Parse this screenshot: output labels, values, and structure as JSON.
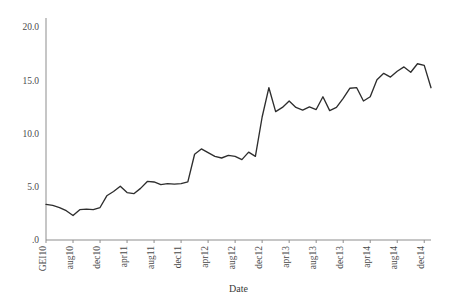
{
  "chart_data": {
    "type": "line",
    "title": "",
    "subtitle": "",
    "xlabel": "Date",
    "ylabel": "",
    "grid": false,
    "legend": "none",
    "ylim": [
      0,
      20
    ],
    "yticks": [
      0,
      5,
      10,
      15,
      20
    ],
    "ytick_labels": [
      ".0",
      "5.0",
      "10.0",
      "15.0",
      "20.0"
    ],
    "xtick_labels": [
      "GEI10",
      "aug10",
      "dec10",
      "apr11",
      "aug11",
      "dec11",
      "apr12",
      "aug12",
      "dec12",
      "apr13",
      "aug13",
      "dec13",
      "apr14",
      "aug14",
      "dec14"
    ],
    "x_tick_every": 4,
    "line_color": "#2e2e2e",
    "axis_color": "#8d8d8d",
    "x": [
      "GEI10",
      "m1",
      "m2",
      "m3",
      "aug10",
      "m5",
      "m6",
      "m7",
      "dec10",
      "m9",
      "m10",
      "m11",
      "apr11",
      "m13",
      "m14",
      "m15",
      "aug11",
      "m17",
      "m18",
      "m19",
      "dec11",
      "m21",
      "m22",
      "m23",
      "apr12",
      "m25",
      "m26",
      "m27",
      "aug12",
      "m29",
      "m30",
      "m31",
      "dec12",
      "m33",
      "m34",
      "m35",
      "apr13",
      "m37",
      "m38",
      "m39",
      "aug13",
      "m41",
      "m42",
      "m43",
      "dec13",
      "m45",
      "m46",
      "m47",
      "apr14",
      "m49",
      "m50",
      "m51",
      "aug14",
      "m53",
      "m54",
      "m55",
      "dec14",
      "m57"
    ],
    "values": [
      3.35,
      3.25,
      3.05,
      2.75,
      2.3,
      2.85,
      2.9,
      2.85,
      3.05,
      4.15,
      4.55,
      5.05,
      4.45,
      4.35,
      4.85,
      5.5,
      5.45,
      5.2,
      5.3,
      5.25,
      5.3,
      5.45,
      8.05,
      8.55,
      8.2,
      7.85,
      7.7,
      7.95,
      7.85,
      7.55,
      8.25,
      7.85,
      11.55,
      14.3,
      12.05,
      12.45,
      13.05,
      12.45,
      12.2,
      12.5,
      12.25,
      13.45,
      12.15,
      12.45,
      13.3,
      14.25,
      14.3,
      13.05,
      13.45,
      15.05,
      15.65,
      15.3,
      15.85,
      16.25,
      15.75,
      16.55,
      16.4,
      14.3
    ]
  },
  "axis": {
    "x_title": "Date"
  }
}
